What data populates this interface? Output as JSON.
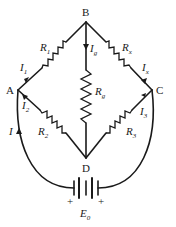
{
  "diagram": {
    "nodes": {
      "B": "B",
      "A": "A",
      "C": "C",
      "D": "D"
    },
    "resistors": {
      "r1": {
        "main": "R",
        "sub": "1"
      },
      "rx": {
        "main": "R",
        "sub": "x"
      },
      "rg": {
        "main": "R",
        "sub": "g"
      },
      "r2": {
        "main": "R",
        "sub": "2"
      },
      "r3": {
        "main": "R",
        "sub": "3"
      }
    },
    "currents": {
      "i1": {
        "main": "I",
        "sub": "1"
      },
      "ix": {
        "main": "I",
        "sub": "x"
      },
      "ig": {
        "main": "I",
        "sub": "g"
      },
      "i2": {
        "main": "I",
        "sub": "2"
      },
      "i3": {
        "main": "I",
        "sub": "3"
      },
      "i": {
        "main": "I"
      }
    },
    "battery": {
      "label_main": "E",
      "label_sub": "0",
      "plus_left": "+",
      "plus_right": "+"
    },
    "colors": {
      "line": "#1a1a1a",
      "background": "#ffffff"
    }
  }
}
